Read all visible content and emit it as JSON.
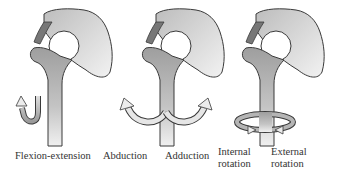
{
  "figure": {
    "panels": [
      {
        "id": "flexion-extension",
        "label": "Flexion-extension"
      },
      {
        "id": "abduction-adduction",
        "labels": [
          "Abduction",
          "Adduction"
        ]
      },
      {
        "id": "rotation",
        "labels": [
          "Internal rotation",
          "External rotation"
        ]
      }
    ],
    "labels": {
      "flexion_extension": "Flexion-extension",
      "abduction": "Abduction",
      "adduction": "Adduction",
      "internal_1": "Internal",
      "internal_2": "rotation",
      "external_1": "External",
      "external_2": "rotation"
    },
    "colors": {
      "pelvis": "#d9d9d9",
      "femur": "#a8a8a8",
      "femur_light": "#e8e8e8",
      "outline": "#3a3a3a",
      "arrow": "#c8c8c8"
    }
  }
}
